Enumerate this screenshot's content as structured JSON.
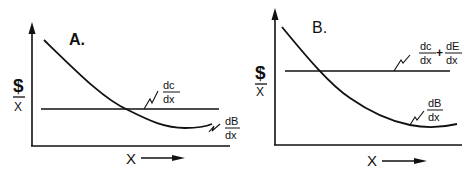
{
  "panels": [
    {
      "id": "A",
      "title": "A.",
      "y_axis_label_top": "$",
      "y_axis_label_bottom": "X",
      "x_axis_label": "X",
      "horizontal_line_label": {
        "num": "dc",
        "den": "dx"
      },
      "curve_label": {
        "num": "dB",
        "den": "dx"
      }
    },
    {
      "id": "B",
      "title": "B.",
      "y_axis_label_top": "$",
      "y_axis_label_bottom": "X",
      "x_axis_label": "X",
      "horizontal_line_label": {
        "num1": "dc",
        "den1": "dx",
        "plus": "+",
        "num2": "dE",
        "den2": "dx"
      },
      "curve_label": {
        "num": "dB",
        "den": "dx"
      }
    }
  ],
  "colors": {
    "ink": "#111111",
    "background": "#ffffff"
  }
}
